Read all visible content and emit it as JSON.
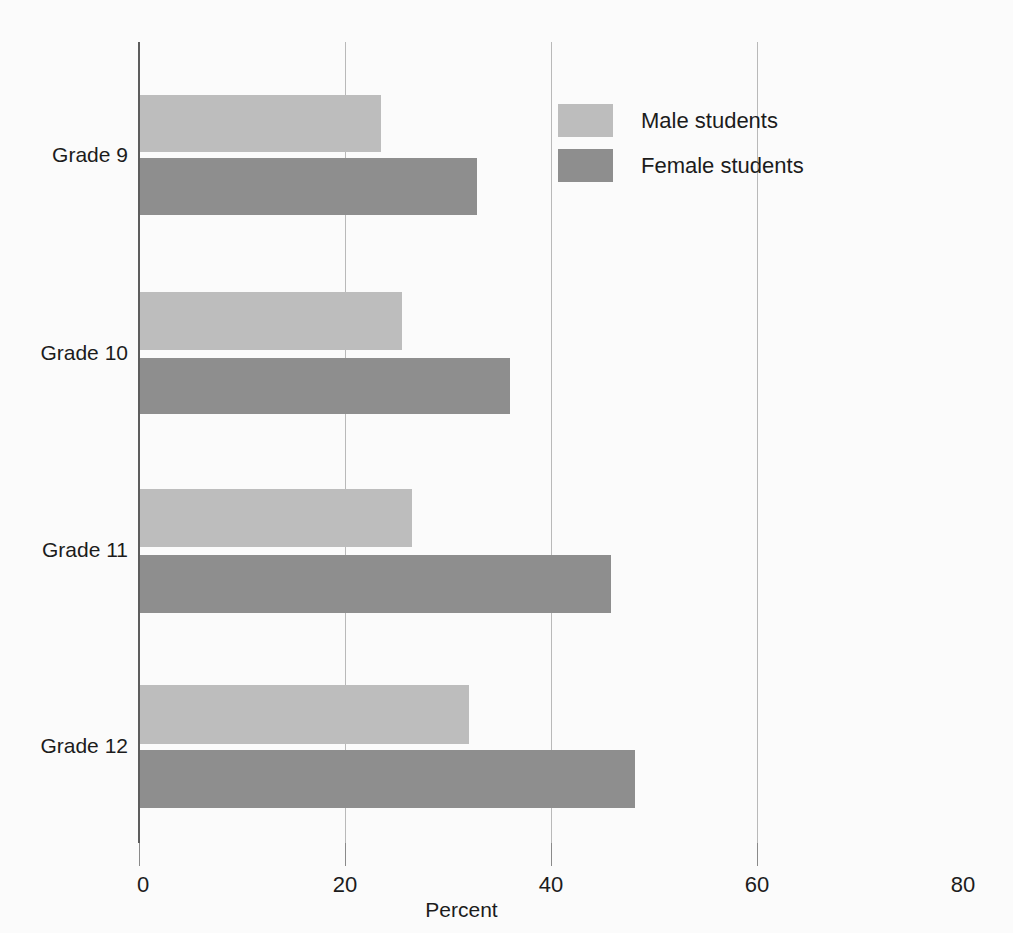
{
  "chart_data": {
    "type": "bar",
    "orientation": "horizontal",
    "title": "",
    "subtitle": "",
    "xlabel": "Percent",
    "ylabel": "",
    "categories": [
      "Grade 9",
      "Grade 10",
      "Grade 11",
      "Grade 12"
    ],
    "series": [
      {
        "name": "Male students",
        "color": "#bdbdbd",
        "values": [
          23.5,
          25.5,
          26.5,
          32.0
        ]
      },
      {
        "name": "Female students",
        "color": "#8e8e8e",
        "values": [
          32.8,
          36.0,
          45.8,
          48.2
        ]
      }
    ],
    "xlim": [
      0,
      80
    ],
    "xticks": [
      0,
      20,
      40,
      60,
      80
    ],
    "xtick_labels": [
      "0",
      "20",
      "40",
      "60",
      "80"
    ],
    "gridlines_x": [
      20,
      40,
      60
    ],
    "grid": true,
    "legend_position": "top-right",
    "legend_entries": [
      "Male students",
      "Female students"
    ]
  },
  "axis": {
    "x_title": "Percent",
    "tick_0": "0",
    "tick_20": "20",
    "tick_40": "40",
    "tick_60": "60",
    "tick_80": "80"
  },
  "categories": {
    "grade_9": "Grade 9",
    "grade_10": "Grade 10",
    "grade_11": "Grade 11",
    "grade_12": "Grade 12"
  },
  "legend": {
    "male_label": "Male students",
    "female_label": "Female students"
  },
  "colors": {
    "male_bar": "#bdbdbd",
    "female_bar": "#8e8e8e",
    "gridline": "#b9b9b9",
    "axis_spine": "#5d5d5d",
    "text": "#1c1c1c",
    "background": "#fbfbfb"
  }
}
